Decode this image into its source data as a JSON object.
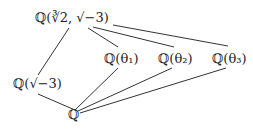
{
  "diagram": {
    "type": "field-extension-lattice",
    "nodes": [
      {
        "id": "top",
        "label": "ℚ(∛2, √−3)",
        "x": 35,
        "y": 10
      },
      {
        "id": "theta1",
        "label": "ℚ(θ₁)",
        "x": 104,
        "y": 51
      },
      {
        "id": "theta2",
        "label": "ℚ(θ₂)",
        "x": 158,
        "y": 51
      },
      {
        "id": "theta3",
        "label": "ℚ(θ₃)",
        "x": 212,
        "y": 51
      },
      {
        "id": "sqrtm3",
        "label": "ℚ(√−3)",
        "x": 13,
        "y": 76
      },
      {
        "id": "Q",
        "label": "ℚ",
        "x": 68,
        "y": 107
      }
    ],
    "edges": [
      {
        "from": "top",
        "to": "theta1",
        "x1": 88,
        "y1": 28,
        "x2": 118,
        "y2": 47
      },
      {
        "from": "top",
        "to": "theta2",
        "x1": 93,
        "y1": 27,
        "x2": 174,
        "y2": 47
      },
      {
        "from": "top",
        "to": "theta3",
        "x1": 113,
        "y1": 25,
        "x2": 228,
        "y2": 46
      },
      {
        "from": "top",
        "to": "sqrtm3",
        "x1": 69,
        "y1": 28,
        "x2": 38,
        "y2": 75
      },
      {
        "from": "sqrtm3",
        "to": "Q",
        "x1": 38,
        "y1": 94,
        "x2": 75,
        "y2": 110
      },
      {
        "from": "Q",
        "to": "theta1",
        "x1": 75,
        "y1": 110,
        "x2": 118,
        "y2": 68
      },
      {
        "from": "Q",
        "to": "theta2",
        "x1": 78,
        "y1": 111,
        "x2": 172,
        "y2": 68
      },
      {
        "from": "Q",
        "to": "theta3",
        "x1": 80,
        "y1": 113,
        "x2": 226,
        "y2": 68
      }
    ],
    "line_color": "#333333"
  }
}
